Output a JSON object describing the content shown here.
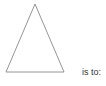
{
  "question": {
    "shape": {
      "type": "triangle",
      "icon": "isosceles-triangle-outline",
      "stroke_color": "#8a8a8a",
      "fill_color": "#ffffff"
    },
    "label": "is to:"
  }
}
